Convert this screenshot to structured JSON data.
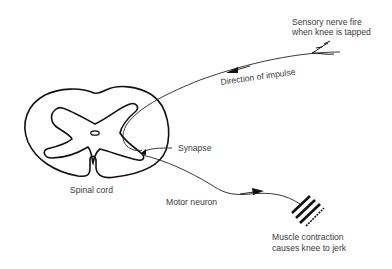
{
  "diagram": {
    "labels": {
      "sensory_line1": "Sensory nerve fire",
      "sensory_line2": "when knee is tapped",
      "direction": "Direction of impulse",
      "synapse": "Synapse",
      "spinal_cord": "Spinal cord",
      "motor_neuron": "Motor neuron",
      "muscle_line1": "Muscle contraction",
      "muscle_line2": "causes knee to jerk"
    },
    "colors": {
      "stroke": "#111111",
      "text": "#3a3a3a",
      "background": "#ffffff"
    }
  }
}
